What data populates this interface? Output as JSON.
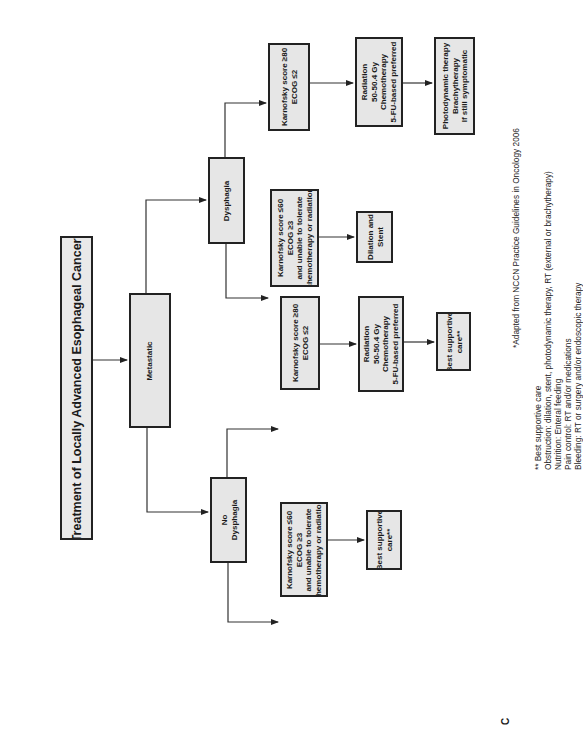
{
  "diagram": {
    "title": "Treatment of Locally Advanced Esophageal Cancer*",
    "panel_label": "C",
    "nodes": {
      "metastatic": "Metastatic",
      "dysphagia": "Dysphagia",
      "no_dysphagia": "No\nDysphagia",
      "d_kps_good": "Karnofsky score ≥80\nECOG ≤2",
      "d_kps_poor": "Karnofsky score ≤60\nECOG ≥3\nand unable to tolerate\nchemotherapy or radiation",
      "d_radiation": "Radiation\n50-50.4 Gy\nChemotherapy\n5-FU-based preferred",
      "d_pdt": "Photodynamic therapy\nBrachytherapy\nIf still symptomatic",
      "d_dilation": "Dilation and\nStent",
      "n_kps_good": "Karnofsky score ≥80\nECOG ≤2",
      "n_radiation": "Radiation\n50-50.4 Gy\nChemotherapy\n5-FU-based preferred",
      "n_bsc_mid": "Best supportive\ncare**",
      "n_kps_poor": "Karnofsky score ≤60\nECOG ≥3\nand unable to tolerate\nchemotherapy or radiation",
      "n_bsc_bottom": "Best supportive\ncare**"
    },
    "footnotes": {
      "source": "*Adapted from NCCN Practice Guidelines in Oncology 2006",
      "bsc_lines": "** Best supportive care\nObstruction: dilation, stent, photodynamic therapy, RT (external or brachytherapy)\nNutrition: Enteral feeding\nPain control: RT and/or medications\nBleeding: RT or surgery and/or endoscopic therapy"
    },
    "colors": {
      "box_fill": "#e6e6e6",
      "border": "#222222",
      "line": "#333333"
    }
  }
}
